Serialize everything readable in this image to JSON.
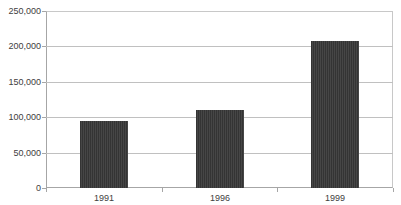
{
  "chart_data": {
    "type": "bar",
    "title": "",
    "subtitle": "",
    "xlabel": "",
    "ylabel": "",
    "categories": [
      "1991",
      "1996",
      "1999"
    ],
    "values": [
      94000,
      110000,
      208000
    ],
    "series": [
      {
        "name": "",
        "values": [
          94000,
          110000,
          208000
        ]
      }
    ],
    "ylim": [
      0,
      250000
    ],
    "ytick_values": [
      250000,
      200000,
      150000,
      100000,
      50000,
      0
    ],
    "ytick_labels": [
      "250,000",
      "200,000",
      "150,000",
      "100,000",
      "50,000",
      "0"
    ],
    "xtick_labels": [
      "1991",
      "1996",
      "1999"
    ],
    "grid": "horizontal",
    "legend": "none",
    "annotations": [],
    "colors": {
      "bar": "#3c3c3c",
      "gridline": "#c0c0c0",
      "axis": "#a6a6a6",
      "plot_border": "#c8c8c8",
      "text": "#404040",
      "background": "#ffffff"
    }
  }
}
